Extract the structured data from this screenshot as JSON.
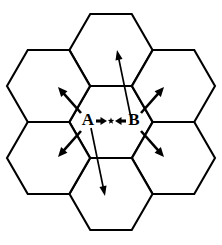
{
  "figure": {
    "background_color": "#ffffff",
    "stroke_color": "#000000",
    "width": 222,
    "height": 245
  },
  "labels": {
    "left_label": "A",
    "right_label": "B",
    "center_marker": "star"
  },
  "icons": {
    "star": "star-icon",
    "arrow_right": "arrow-right-icon",
    "arrow_left": "arrow-left-icon",
    "arrow_up": "arrow-up-icon",
    "arrow_down": "arrow-down-icon",
    "arrow_up_left": "arrow-up-left-icon",
    "arrow_up_right": "arrow-up-right-icon",
    "arrow_down_left": "arrow-down-left-icon",
    "arrow_down_right": "arrow-down-right-icon"
  },
  "chart_data": {
    "type": "diagram",
    "xlabel": "",
    "ylabel": "",
    "hex_orientation": "flat-top",
    "hex_circumradius": 41.5,
    "hex_count": 7,
    "center": {
      "x": 111,
      "y": 122
    },
    "hex_centers": [
      {
        "name": "center",
        "x": 111,
        "y": 122
      },
      {
        "name": "top",
        "x": 111,
        "y": 50
      },
      {
        "name": "upper-right",
        "x": 173.5,
        "y": 86
      },
      {
        "name": "lower-right",
        "x": 173.5,
        "y": 158
      },
      {
        "name": "bottom",
        "x": 111,
        "y": 194
      },
      {
        "name": "lower-left",
        "x": 48.5,
        "y": 158
      },
      {
        "name": "upper-left",
        "x": 48.5,
        "y": 86
      }
    ],
    "arrows": [
      {
        "name": "arrow-up",
        "x1": 131,
        "y1": 118,
        "x2": 117,
        "y2": 50,
        "length": 69,
        "style": "long"
      },
      {
        "name": "arrow-down",
        "x1": 91,
        "y1": 128,
        "x2": 105,
        "y2": 196,
        "length": 69,
        "style": "long"
      },
      {
        "name": "arrow-up-left",
        "x1": 81,
        "y1": 113,
        "x2": 58,
        "y2": 87,
        "length": 35,
        "style": "short"
      },
      {
        "name": "arrow-up-right",
        "x1": 141,
        "y1": 113,
        "x2": 164,
        "y2": 87,
        "length": 35,
        "style": "short"
      },
      {
        "name": "arrow-down-left",
        "x1": 81,
        "y1": 131,
        "x2": 58,
        "y2": 157,
        "length": 35,
        "style": "short"
      },
      {
        "name": "arrow-down-right",
        "x1": 141,
        "y1": 131,
        "x2": 164,
        "y2": 157,
        "length": 35,
        "style": "short"
      }
    ],
    "center_arrows": [
      {
        "name": "arrow-A-right",
        "from_label": "A",
        "x1": 96,
        "y1": 121,
        "x2": 107,
        "y2": 121,
        "direction": "right"
      },
      {
        "name": "arrow-B-left",
        "from_label": "B",
        "x1": 126,
        "y1": 121,
        "x2": 115,
        "y2": 121,
        "direction": "left"
      }
    ],
    "label_positions": [
      {
        "text": "A",
        "x": 88,
        "y": 121
      },
      {
        "text": "B",
        "x": 134,
        "y": 121
      }
    ],
    "star_position": {
      "x": 111,
      "y": 121,
      "radius": 3.4
    },
    "grid": false,
    "legend": "none"
  }
}
